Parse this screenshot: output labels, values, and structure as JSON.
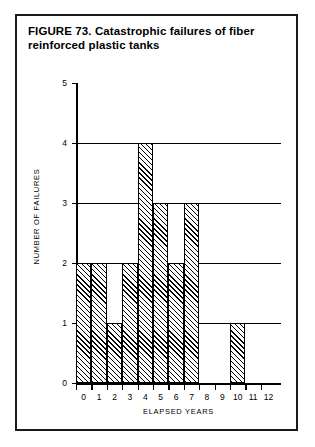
{
  "figure": {
    "caption": "FIGURE 73. Catastrophic failures of fiber reinforced plastic tanks"
  },
  "chart_data": {
    "type": "bar",
    "title": "FIGURE 73. Catastrophic failures of fiber reinforced plastic tanks",
    "xlabel": "ELAPSED YEARS",
    "ylabel": "NUMBER OF FAILURES",
    "categories": [
      "0",
      "1",
      "2",
      "3",
      "4",
      "5",
      "6",
      "7",
      "8",
      "9",
      "10",
      "11",
      "12"
    ],
    "values": [
      2,
      2,
      1,
      2,
      4,
      3,
      2,
      3,
      0,
      0,
      1,
      0,
      0
    ],
    "xlim": [
      0,
      12
    ],
    "ylim": [
      0,
      5
    ],
    "y_ticks": [
      "0",
      "1",
      "2",
      "3",
      "4",
      "5"
    ],
    "x_ticks": [
      "0",
      "1",
      "2",
      "3",
      "4",
      "5",
      "6",
      "7",
      "8",
      "9",
      "10",
      "11",
      "12"
    ],
    "grid": "horizontal gridlines at y = 1, 2, 3, 4",
    "legend": "none",
    "bar_fill": "diagonal hatch",
    "bar_outline_color": "#000000"
  }
}
